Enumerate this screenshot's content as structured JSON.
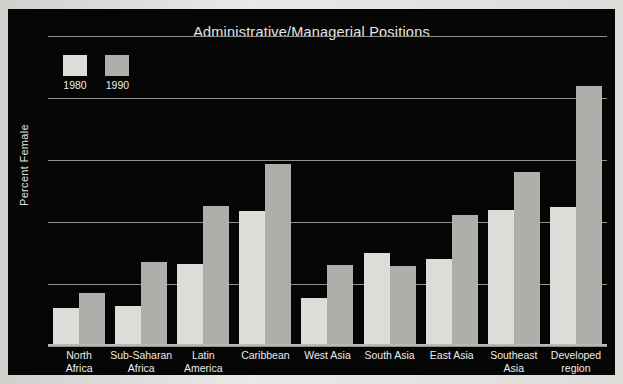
{
  "chart_data": {
    "type": "bar",
    "title": "Administrative/Managerial Positions",
    "xlabel": "",
    "ylabel": "Percent Female",
    "ylim": [
      0,
      50
    ],
    "yticks": [
      0,
      10,
      20,
      30,
      40,
      50
    ],
    "grid": true,
    "legend_position": "top-left",
    "categories": [
      "North\nAfrica",
      "Sub-Saharan\nAfrica",
      "Latin\nAmerica",
      "Caribbean",
      "West Asia",
      "South Asia",
      "East Asia",
      "Southeast\nAsia",
      "Developed\nregion"
    ],
    "series": [
      {
        "name": "1980",
        "color": "#dcdcd8",
        "values": [
          6.2,
          6.4,
          13.2,
          21.8,
          7.8,
          15.0,
          14.0,
          22.0,
          22.4
        ]
      },
      {
        "name": "1990",
        "color": "#aeaeaa",
        "values": [
          8.6,
          13.5,
          22.6,
          29.3,
          13.1,
          12.9,
          21.1,
          28.1,
          42.0
        ]
      }
    ]
  },
  "legend": {
    "items": [
      {
        "label": "1980"
      },
      {
        "label": "1990"
      }
    ]
  },
  "colors": {
    "panel_background": "#050505",
    "page_background": "#dcdcd8",
    "gridline": "#8f8f8c",
    "text": "#ececea",
    "series_1980": "#dcdcd8",
    "series_1990": "#aeaeaa"
  }
}
